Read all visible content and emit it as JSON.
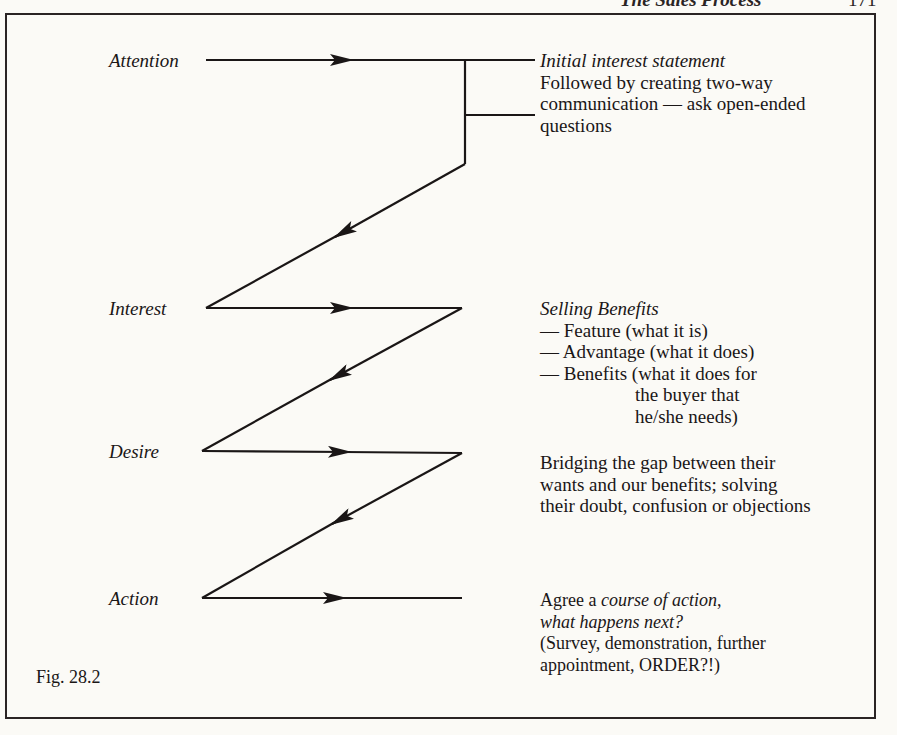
{
  "running_head": {
    "title": "The Sales Process",
    "page_number": "171"
  },
  "diagram": {
    "type": "zigzag-flow",
    "stages": [
      {
        "label": "Attention"
      },
      {
        "label": "Interest"
      },
      {
        "label": "Desire"
      },
      {
        "label": "Action"
      }
    ],
    "notes": {
      "attention": {
        "heading": "Initial interest statement",
        "lines": [
          "Followed by creating two-way",
          "communication — ask open-ended",
          "questions"
        ]
      },
      "interest": {
        "heading": "Selling Benefits",
        "items": [
          "— Feature (what it is)",
          "— Advantage (what it does)",
          "— Benefits (what it does for"
        ],
        "continuation": [
          "the buyer that",
          "he/she needs)"
        ]
      },
      "desire": {
        "lines": [
          "Bridging the gap between their",
          "wants and our benefits; solving",
          "their doubt, confusion or objections"
        ]
      },
      "action": {
        "line1_prefix": "Agree a ",
        "line1_italic": "course of action",
        "line1_suffix": ",",
        "line2_italic": "what happens next?",
        "lines": [
          "(Survey, demonstration, further",
          "appointment,  ORDER?!)"
        ]
      }
    },
    "figure_label": "Fig. 28.2",
    "colors": {
      "ink": "#1a1616",
      "paper": "#fbfaf6"
    }
  }
}
